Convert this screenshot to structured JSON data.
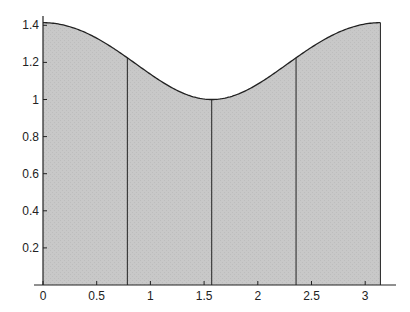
{
  "chart_data": {
    "type": "area",
    "title": "",
    "xlabel": "",
    "ylabel": "",
    "function": "sqrt(1+cos(x)^2)",
    "xlim": [
      0,
      3.14159
    ],
    "ylim": [
      0,
      1.42
    ],
    "grid": false,
    "legend": null,
    "x_ticks": [
      "0",
      "0.5",
      "1",
      "1.5",
      "2",
      "2.5",
      "3"
    ],
    "y_ticks": [
      "0.2",
      "0.4",
      "0.6",
      "0.8",
      "1",
      "1.2",
      "1.4"
    ],
    "partition_lines_x": [
      0.7854,
      1.5708,
      2.3562
    ],
    "partition_lines_y": [
      1.2247,
      1.0,
      1.2247
    ],
    "curve_points": [
      {
        "x": 0,
        "y": 1.414
      },
      {
        "x": 0.3927,
        "y": 1.361
      },
      {
        "x": 0.7854,
        "y": 1.225
      },
      {
        "x": 1.1781,
        "y": 1.071
      },
      {
        "x": 1.5708,
        "y": 1.0
      },
      {
        "x": 1.9635,
        "y": 1.071
      },
      {
        "x": 2.3562,
        "y": 1.225
      },
      {
        "x": 2.7489,
        "y": 1.361
      },
      {
        "x": 3.1416,
        "y": 1.414
      }
    ],
    "fill_color": "#c6c6c6",
    "line_color": "#222222"
  }
}
